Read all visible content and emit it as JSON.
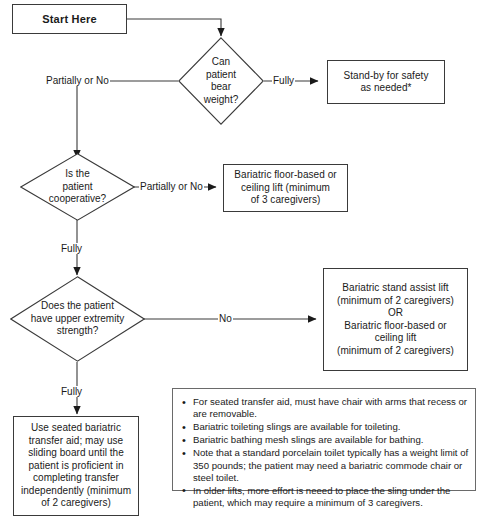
{
  "nodes": {
    "start": {
      "label": "Start Here"
    },
    "d1": {
      "label": "Can\npatient\nbear\nweight?",
      "line1": "Can",
      "line2": "patient",
      "line3": "bear",
      "line4": "weight?"
    },
    "standby": {
      "line1": "Stand-by for safety",
      "line2": "as needed*"
    },
    "d2": {
      "line1": "Is the",
      "line2": "patient",
      "line3": "cooperative?"
    },
    "floorlift": {
      "line1": "Bariatric floor-based or",
      "line2": "ceiling lift (minimum",
      "line3": "of 3 caregivers)"
    },
    "d3": {
      "line1": "Does the patient",
      "line2": "have upper extremity",
      "line3": "strength?"
    },
    "standassist": {
      "line1": "Bariatric stand assist lift",
      "line2": "(minimum of 2 caregivers)",
      "line3": "OR",
      "line4": "Bariatric floor-based or",
      "line5": "ceiling lift",
      "line6": "(minimum of 2 caregivers)"
    },
    "seated": {
      "line1": "Use seated bariatric",
      "line2": "transfer aid; may use",
      "line3": "sliding board until the",
      "line4": "patient is proficient in",
      "line5": "completing transfer",
      "line6": "independently (minimum",
      "line7": "of 2 caregivers)"
    }
  },
  "edge_labels": {
    "d1_left": "Partially or No",
    "d1_right": "Fully",
    "d2_right": "Partially or No",
    "d2_down": "Fully",
    "d3_right": "No",
    "d3_down": "Fully"
  },
  "notes": {
    "bullet_glyph": "•",
    "items": [
      "For seated transfer aid, must have chair with arms that recess or are removable.",
      "Bariatric toileting slings are available for toileting.",
      "Bariatric bathing mesh slings are available for bathing.",
      "Note that a standard porcelain toilet typically has a weight limit of 350 pounds; the patient may need a bariatric commode chair or steel toilet.",
      "In older lifts, more effort is neeed to place the sling under the patient, which may require a minimum of 3 caregivers."
    ]
  },
  "colors": {
    "line": "#3a3a3a",
    "note_border": "#6a6a6a",
    "text": "#1a1a1a",
    "background": "#ffffff"
  }
}
